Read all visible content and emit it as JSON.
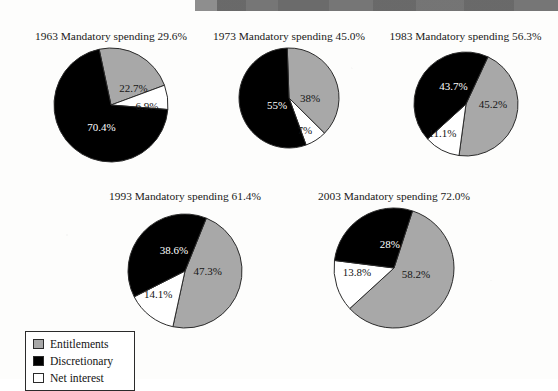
{
  "page": {
    "header_bar_text": "",
    "background_color": "#fdfdfc",
    "header_bar_color": "#6f6f6f"
  },
  "colors": {
    "entitlements": "#a8a8a8",
    "discretionary": "#000000",
    "net_interest": "#ffffff",
    "outline": "#2b2b2b"
  },
  "legend": {
    "items": [
      {
        "label": "Entitlements",
        "swatch": "gray-swatch-icon",
        "color": "#a8a8a8"
      },
      {
        "label": "Discretionary",
        "swatch": "black-swatch-icon",
        "color": "#000000"
      },
      {
        "label": "Net interest",
        "swatch": "white-swatch-icon",
        "color": "#ffffff"
      }
    ]
  },
  "chart_data": {
    "type": "pie",
    "title": "",
    "legend": [
      "Entitlements",
      "Discretionary",
      "Net interest"
    ],
    "legend_position": "bottom-left",
    "series_names": [
      "Entitlements",
      "Discretionary",
      "Net interest"
    ],
    "charts": [
      {
        "year": "1963",
        "title": "1963 Mandatory spending 29.6%",
        "mandatory_spending_pct": 29.6,
        "labels": [
          "Entitlements",
          "Net interest",
          "Discretionary"
        ],
        "values": [
          22.7,
          6.9,
          70.4
        ],
        "value_labels": [
          "22.7%",
          "6.9%",
          "70.4%"
        ]
      },
      {
        "year": "1973",
        "title": "1973 Mandatory spending 45.0%",
        "mandatory_spending_pct": 45.0,
        "labels": [
          "Entitlements",
          "Net interest",
          "Discretionary"
        ],
        "values": [
          38,
          7,
          55
        ],
        "value_labels": [
          "38%",
          "7%",
          "55%"
        ]
      },
      {
        "year": "1983",
        "title": "1983 Mandatory spending 56.3%",
        "mandatory_spending_pct": 56.3,
        "labels": [
          "Entitlements",
          "Net interest",
          "Discretionary"
        ],
        "values": [
          45.2,
          11.1,
          43.7
        ],
        "value_labels": [
          "45.2%",
          "11.1%",
          "43.7%"
        ]
      },
      {
        "year": "1993",
        "title": "1993 Mandatory spending 61.4%",
        "mandatory_spending_pct": 61.4,
        "labels": [
          "Entitlements",
          "Net interest",
          "Discretionary"
        ],
        "values": [
          47.3,
          14.1,
          38.6
        ],
        "value_labels": [
          "47.3%",
          "14.1%",
          "38.6%"
        ]
      },
      {
        "year": "2003",
        "title": "2003 Mandatory spending 72.0%",
        "mandatory_spending_pct": 72.0,
        "labels": [
          "Entitlements",
          "Net interest",
          "Discretionary"
        ],
        "values": [
          58.2,
          13.8,
          28
        ],
        "value_labels": [
          "58.2%",
          "13.8%",
          "28%"
        ]
      }
    ]
  },
  "layout": {
    "charts": [
      {
        "block_left": 8,
        "block_top": 30,
        "block_width": 206,
        "pie_top": 16,
        "radius": 57,
        "start_angle": 258,
        "label_pos": [
          [
            0.5,
            0.58
          ],
          [
            0.63,
            0.25
          ],
          [
            0.42,
            -0.45
          ]
        ]
      },
      {
        "block_left": 196,
        "block_top": 30,
        "block_width": 186,
        "pie_top": 16,
        "radius": 50,
        "start_angle": 268,
        "label_pos": [
          [
            0.42,
            0.58
          ],
          [
            0.72,
            0.16
          ],
          [
            0.28,
            -0.5
          ]
        ]
      },
      {
        "block_left": 373,
        "block_top": 30,
        "block_width": 185,
        "pie_top": 20,
        "radius": 52,
        "start_angle": 295,
        "label_pos": [
          [
            0.52,
            -0.42
          ],
          [
            0.72,
            0.28
          ],
          [
            0.42,
            0.46
          ]
        ]
      },
      {
        "block_left": 95,
        "block_top": 190,
        "block_width": 180,
        "pie_top": 22,
        "radius": 57,
        "start_angle": 292,
        "label_pos": [
          [
            0.4,
            -0.42
          ],
          [
            0.62,
            0.3
          ],
          [
            0.42,
            0.5
          ]
        ]
      },
      {
        "block_left": 290,
        "block_top": 190,
        "block_width": 208,
        "pie_top": 16,
        "radius": 60,
        "start_angle": 288,
        "label_pos": [
          [
            0.38,
            -0.42
          ],
          [
            0.62,
            0.3
          ],
          [
            0.4,
            0.56
          ]
        ]
      }
    ]
  }
}
